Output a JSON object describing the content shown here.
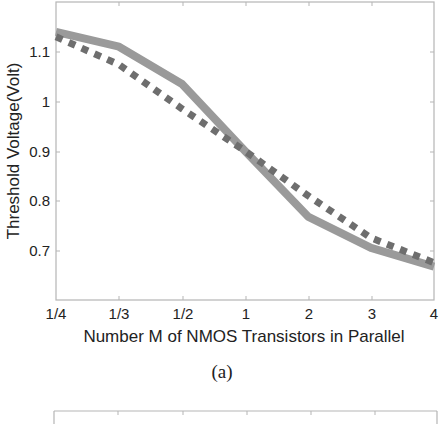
{
  "chart_data": [
    {
      "type": "line",
      "title": "",
      "caption": "(a)",
      "xlabel": "Number M of NMOS Transistors in Parallel",
      "ylabel": "Threshold Voltage(Volt)",
      "categories": [
        "1/4",
        "1/3",
        "1/2",
        "1",
        "2",
        "3",
        "4"
      ],
      "x_scale": "log-spaced categorical (evenly spaced ticks)",
      "yticks": [
        0.7,
        0.8,
        0.9,
        1,
        1.1
      ],
      "ytick_labels": [
        "0.7",
        "0.8",
        "0.9",
        "1",
        "1.1"
      ],
      "ylim": [
        0.6,
        1.2
      ],
      "grid": false,
      "legend": null,
      "series": [
        {
          "name": "solid",
          "style": "solid",
          "color": "#9a9a9a",
          "values": [
            1.14,
            1.11,
            1.035,
            0.9,
            0.768,
            0.705,
            0.667
          ]
        },
        {
          "name": "dotted",
          "style": "dotted",
          "color": "#6e6e6e",
          "values": [
            1.13,
            1.074,
            0.985,
            0.9,
            0.81,
            0.725,
            0.675
          ]
        }
      ]
    }
  ],
  "labels": {
    "caption": "(a)",
    "xlabel": "Number M of NMOS Transistors in Parallel",
    "ylabel": "Threshold Voltage(Volt)",
    "xticks": [
      "1/4",
      "1/3",
      "1/2",
      "1",
      "2",
      "3",
      "4"
    ],
    "yticks": [
      "1.1",
      "1",
      "0.9",
      "0.8",
      "0.7"
    ]
  }
}
